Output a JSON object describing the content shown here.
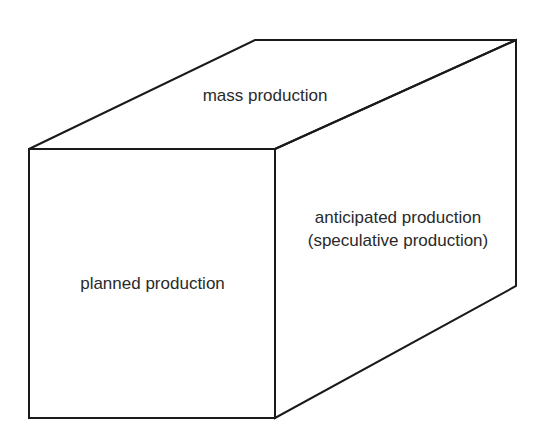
{
  "diagram": {
    "type": "3d-box",
    "faces": {
      "top": {
        "label": "mass production"
      },
      "front": {
        "label": "planned production"
      },
      "side": {
        "line1": "anticipated production",
        "line2": "(speculative production)"
      }
    },
    "colors": {
      "stroke": "#1a1a1a",
      "text": "#2a2a2a",
      "background": "#ffffff"
    }
  }
}
